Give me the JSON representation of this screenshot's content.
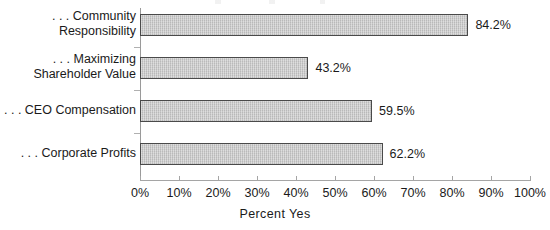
{
  "chart_data": {
    "type": "bar",
    "orientation": "horizontal",
    "title": "",
    "xlabel": "Percent Yes",
    "ylabel": "",
    "xlim": [
      0,
      100
    ],
    "grid": false,
    "legend": null,
    "value_suffix": "%",
    "categories": [
      ". . . Community\nResponsibility",
      ". . . Maximizing\nShareholder Value",
      ". . . CEO Compensation",
      ". . . Corporate Profits"
    ],
    "values": [
      84.2,
      43.2,
      59.5,
      62.2
    ],
    "value_labels": [
      "84.2%",
      "43.2%",
      "59.5%",
      "62.2%"
    ],
    "xticks": [
      0,
      10,
      20,
      30,
      40,
      50,
      60,
      70,
      80,
      90,
      100
    ],
    "xtick_labels": [
      "0%",
      "10%",
      "20%",
      "30%",
      "40%",
      "50%",
      "60%",
      "70%",
      "80%",
      "90%",
      "100%"
    ],
    "bar_fill_color": "#c9c9c9",
    "bar_border_color": "#4a4a4a",
    "axis_color": "#a5a5a5",
    "text_color": "#1a1a1a"
  }
}
